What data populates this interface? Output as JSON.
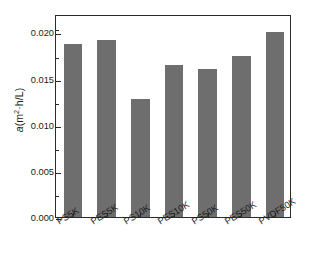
{
  "chart_data": {
    "type": "bar",
    "title": "",
    "xlabel": "",
    "ylabel": "a(m2·h/L)",
    "ylabel_parts": {
      "symbol": "a",
      "open": "(m",
      "exponent": "2",
      "rest": "·h/L)"
    },
    "categories": [
      "PS5K",
      "PES5K",
      "PS10K",
      "PES10K",
      "PS50K",
      "PES50K",
      "PVDF50K"
    ],
    "values": [
      0.0187,
      0.0192,
      0.0128,
      0.0165,
      0.016,
      0.0174,
      0.0201
    ],
    "ylim": [
      0.0,
      0.022
    ],
    "yticks": [
      0.0,
      0.005,
      0.01,
      0.015,
      0.02
    ],
    "ytick_labels": [
      "0.000",
      "0.005",
      "0.010",
      "0.015",
      "0.020"
    ],
    "yminor_ticks": [
      0.0025,
      0.0075,
      0.0125,
      0.0175,
      0.0205
    ],
    "grid": false,
    "legend": null,
    "bar_color": "#6e6e6e",
    "axis_color": "#2b2b2b",
    "text_color": "#1a1a1a",
    "background": "#ffffff",
    "xtick_label_rotation": -32
  }
}
